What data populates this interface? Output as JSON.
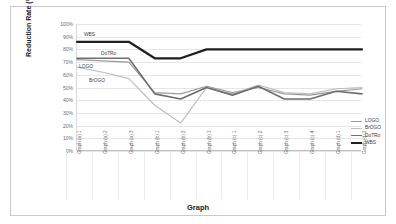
{
  "chart_data": {
    "type": "line",
    "title": "",
    "xlabel": "Graph",
    "ylabel": "Reduction Rate (%)",
    "ylim": [
      0,
      100
    ],
    "yticks": [
      "0%",
      "10%",
      "20%",
      "30%",
      "40%",
      "50%",
      "60%",
      "70%",
      "80%",
      "90%",
      "100%"
    ],
    "grid": true,
    "legend_position": "bottom-right",
    "categories": [
      "Graph (a) 1",
      "Graph (a) 2",
      "Graph (a) 3",
      "Graph (b) 1",
      "Graph (b) 2",
      "Graph (b) 3",
      "Graph (c) 1",
      "Graph (c) 2",
      "Graph (c) 3",
      "Graph (c) 4",
      "Graph (d) 1",
      "Graph (d) 2"
    ],
    "series": [
      {
        "name": "LOGO",
        "color": "#9b9b9b",
        "width": 1.2,
        "values": [
          72,
          71,
          70,
          46,
          45,
          51,
          46,
          50,
          45,
          44,
          47,
          49
        ]
      },
      {
        "name": "BrOGO",
        "color": "#bdbdbd",
        "width": 1.2,
        "values": [
          66,
          62,
          57,
          36,
          22,
          50,
          45,
          52,
          46,
          45,
          49,
          50
        ]
      },
      {
        "name": "DoTRo",
        "color": "#6e6e6e",
        "width": 1.6,
        "values": [
          73,
          73,
          73,
          45,
          41,
          50,
          44,
          51,
          41,
          41,
          47,
          45
        ]
      },
      {
        "name": "WBS",
        "color": "#1f1f1f",
        "width": 2.2,
        "values": [
          86,
          86,
          86,
          73,
          73,
          80,
          80,
          80,
          80,
          80,
          80,
          80
        ]
      }
    ],
    "inline_labels": [
      {
        "text": "WBS",
        "left": 72,
        "top": 26
      },
      {
        "text": "DoTRo",
        "left": 89,
        "top": 45
      },
      {
        "text": "LOGO",
        "left": 67,
        "top": 58
      },
      {
        "text": "BrOGO",
        "left": 77,
        "top": 72
      }
    ]
  }
}
